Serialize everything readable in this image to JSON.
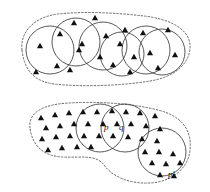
{
  "figure": {
    "background_color": "#ffffff",
    "stroke_color": "#3b3b3b",
    "blob_stroke_color": "#58595b",
    "point_color": "#111111",
    "width": 210,
    "height": 192
  },
  "labels": {
    "p": "p",
    "q": "q",
    "p_prime": "p'"
  },
  "chart_data": {
    "type": "scatter",
    "xlabel": "",
    "ylabel": "",
    "xlim": [
      0,
      210
    ],
    "ylim": [
      0,
      192
    ],
    "grid": false,
    "legend": "none",
    "marker": "triangle",
    "regions": [
      {
        "name": "upper-region",
        "blob_path": "M 22 50 C 20 32 34 17 58 14 C 86 11 118 13 144 16 C 170 19 189 29 190 45 C 191 62 176 77 150 81 C 120 86 80 87 54 84 C 32 81 24 68 22 50 Z",
        "disks": [
          {
            "cx": 50,
            "cy": 50,
            "r": 24
          },
          {
            "cx": 76,
            "cy": 42,
            "r": 24
          },
          {
            "cx": 103,
            "cy": 46,
            "r": 24
          },
          {
            "cx": 122,
            "cy": 54,
            "r": 22
          },
          {
            "cx": 146,
            "cy": 50,
            "r": 24
          },
          {
            "cx": 162,
            "cy": 52,
            "r": 23
          }
        ],
        "points": [
          [
            40,
            46
          ],
          [
            36,
            72
          ],
          [
            57,
            66
          ],
          [
            60,
            34
          ],
          [
            70,
            70
          ],
          [
            74,
            23
          ],
          [
            79,
            50
          ],
          [
            82,
            44
          ],
          [
            95,
            18
          ],
          [
            100,
            57
          ],
          [
            106,
            36
          ],
          [
            113,
            65
          ],
          [
            120,
            44
          ],
          [
            125,
            30
          ],
          [
            130,
            72
          ],
          [
            134,
            57
          ],
          [
            143,
            33
          ],
          [
            150,
            53
          ],
          [
            158,
            68
          ],
          [
            168,
            30
          ],
          [
            175,
            55
          ]
        ]
      },
      {
        "name": "lower-region",
        "blob_path": "M 30 128 C 28 112 44 104 70 103 C 100 101 134 104 158 110 C 182 116 192 130 190 150 C 188 170 170 182 150 183 C 128 184 112 176 104 165 C 96 154 80 158 62 157 C 42 156 32 144 30 128 Z",
        "disks": [
          {
            "cx": 100,
            "cy": 128,
            "r": 24
          },
          {
            "cx": 125,
            "cy": 128,
            "r": 24
          },
          {
            "cx": 162,
            "cy": 152,
            "r": 24
          }
        ],
        "points": [
          [
            41,
            118
          ],
          [
            55,
            115
          ],
          [
            69,
            113
          ],
          [
            83,
            112
          ],
          [
            97,
            112
          ],
          [
            112,
            111
          ],
          [
            126,
            112
          ],
          [
            140,
            113
          ],
          [
            155,
            116
          ],
          [
            46,
            128
          ],
          [
            60,
            126
          ],
          [
            74,
            124
          ],
          [
            88,
            124
          ],
          [
            103,
            124
          ],
          [
            117,
            124
          ],
          [
            131,
            124
          ],
          [
            146,
            126
          ],
          [
            160,
            129
          ],
          [
            42,
            139
          ],
          [
            56,
            137
          ],
          [
            70,
            136
          ],
          [
            84,
            136
          ],
          [
            99,
            136
          ],
          [
            113,
            136
          ],
          [
            128,
            137
          ],
          [
            142,
            139
          ],
          [
            157,
            141
          ],
          [
            48,
            150
          ],
          [
            62,
            148
          ],
          [
            77,
            147
          ],
          [
            91,
            147
          ],
          [
            145,
            152
          ],
          [
            159,
            152
          ],
          [
            173,
            154
          ],
          [
            152,
            163
          ],
          [
            166,
            164
          ],
          [
            180,
            163
          ],
          [
            160,
            175
          ],
          [
            174,
            176
          ]
        ],
        "label_positions": {
          "p": [
            104,
            130
          ],
          "q": [
            119,
            130
          ],
          "p'": [
            168,
            177
          ]
        }
      }
    ]
  }
}
